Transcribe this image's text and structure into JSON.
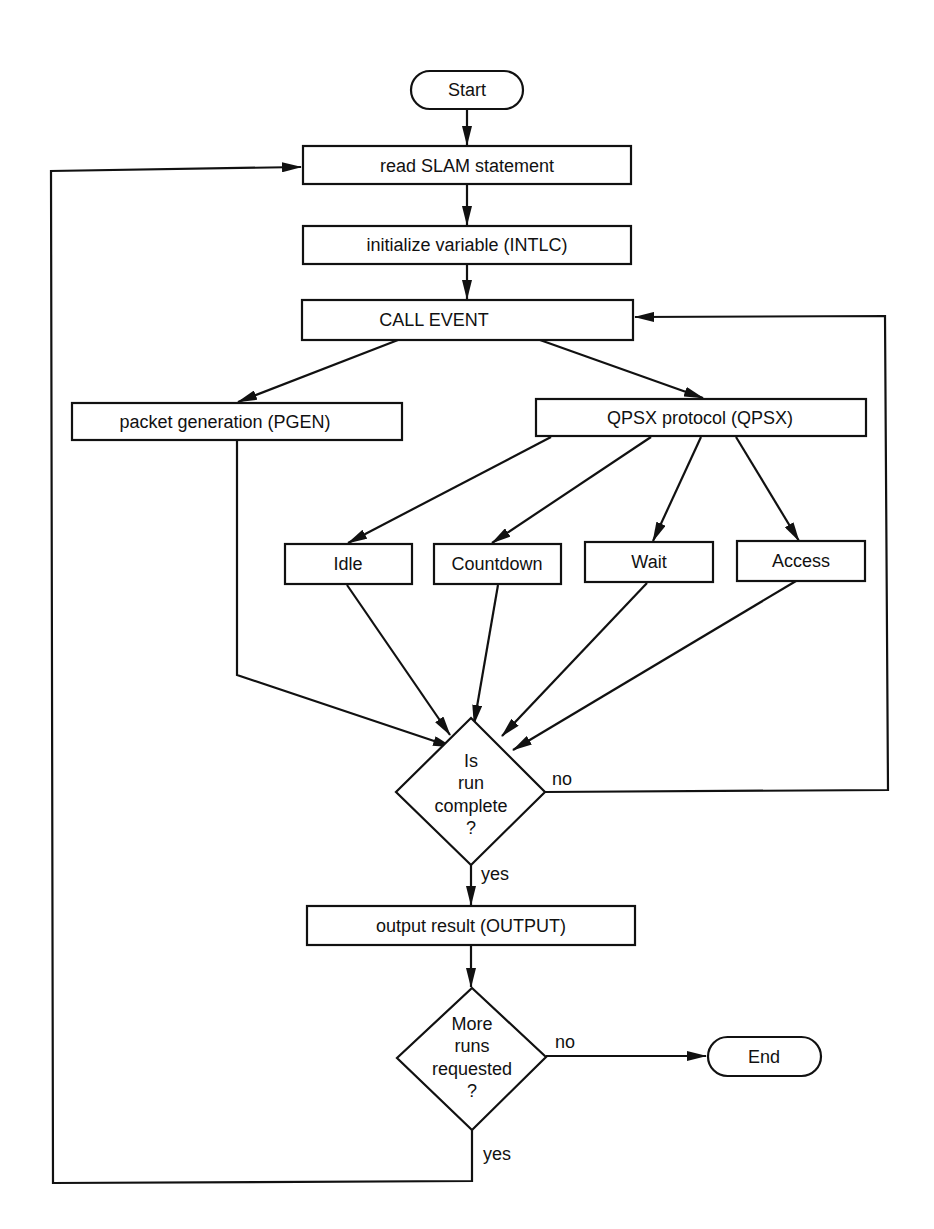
{
  "diagram": {
    "type": "flowchart",
    "nodes": {
      "start": {
        "label": "Start",
        "shape": "terminal"
      },
      "read": {
        "label": "read SLAM statement",
        "shape": "process"
      },
      "init": {
        "label": "initialize variable (INTLC)",
        "shape": "process"
      },
      "call_event": {
        "label": "CALL EVENT",
        "shape": "process"
      },
      "pgen": {
        "label": "packet generation (PGEN)",
        "shape": "process"
      },
      "qpsx": {
        "label": "QPSX protocol (QPSX)",
        "shape": "process"
      },
      "idle": {
        "label": "Idle",
        "shape": "process"
      },
      "countdown": {
        "label": "Countdown",
        "shape": "process"
      },
      "wait": {
        "label": "Wait",
        "shape": "process"
      },
      "access": {
        "label": "Access",
        "shape": "process"
      },
      "run_complete": {
        "lines": [
          "Is",
          "run",
          "complete",
          "?"
        ],
        "shape": "decision"
      },
      "output": {
        "label": "output result (OUTPUT)",
        "shape": "process"
      },
      "more_runs": {
        "lines": [
          "More",
          "runs",
          "requested",
          "?"
        ],
        "shape": "decision"
      },
      "end": {
        "label": "End",
        "shape": "terminal"
      }
    },
    "edge_labels": {
      "run_complete_no": "no",
      "run_complete_yes": "yes",
      "more_runs_no": "no",
      "more_runs_yes": "yes"
    },
    "edges": [
      {
        "from": "start",
        "to": "read"
      },
      {
        "from": "read",
        "to": "init"
      },
      {
        "from": "init",
        "to": "call_event"
      },
      {
        "from": "call_event",
        "to": "pgen"
      },
      {
        "from": "call_event",
        "to": "qpsx"
      },
      {
        "from": "qpsx",
        "to": "idle"
      },
      {
        "from": "qpsx",
        "to": "countdown"
      },
      {
        "from": "qpsx",
        "to": "wait"
      },
      {
        "from": "qpsx",
        "to": "access"
      },
      {
        "from": "pgen",
        "to": "run_complete"
      },
      {
        "from": "idle",
        "to": "run_complete"
      },
      {
        "from": "countdown",
        "to": "run_complete"
      },
      {
        "from": "wait",
        "to": "run_complete"
      },
      {
        "from": "access",
        "to": "run_complete"
      },
      {
        "from": "run_complete",
        "to": "call_event",
        "label": "no"
      },
      {
        "from": "run_complete",
        "to": "output",
        "label": "yes"
      },
      {
        "from": "output",
        "to": "more_runs"
      },
      {
        "from": "more_runs",
        "to": "end",
        "label": "no"
      },
      {
        "from": "more_runs",
        "to": "read",
        "label": "yes"
      }
    ],
    "colors": {
      "stroke": "#111111",
      "background": "#ffffff"
    }
  }
}
